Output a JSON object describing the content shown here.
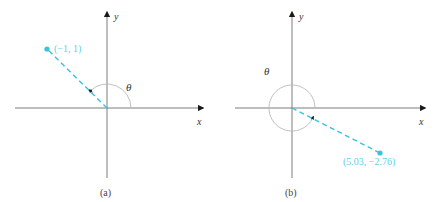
{
  "panels": [
    {
      "id": "a",
      "caption": "(a)",
      "x_axis_label": "x",
      "y_axis_label": "y",
      "angle_label": "θ",
      "point_label": "(−1, 1)",
      "point": {
        "x": -1,
        "y": 1
      }
    },
    {
      "id": "b",
      "caption": "(b)",
      "x_axis_label": "x",
      "y_axis_label": "y",
      "angle_label": "θ",
      "point_label": "(5.03, −2.76)",
      "point": {
        "x": 5.03,
        "y": -2.76
      }
    }
  ],
  "colors": {
    "point": "#35c3e0",
    "axis": "#6e6e6e",
    "arc": "#b8b8b8"
  }
}
